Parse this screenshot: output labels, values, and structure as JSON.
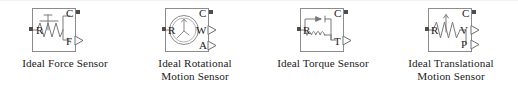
{
  "page": {
    "background_color": "#ffffff",
    "block_line_color": "#8c8c8c",
    "symbol_color": "#7a7a7a",
    "port_color": "#4d4d4d",
    "text_color": "#1b1b1b"
  },
  "blocks": [
    {
      "id": "ideal-force-sensor",
      "caption_line1": "Ideal Force Sensor",
      "caption_line2": "",
      "symbol": "spring-plunger",
      "ports": [
        {
          "name": "R",
          "label": "R",
          "kind": "conserving",
          "side": "left"
        },
        {
          "name": "C",
          "label": "C",
          "kind": "conserving",
          "side": "right-top"
        },
        {
          "name": "F",
          "label": "F",
          "kind": "signal",
          "side": "right-bottom"
        }
      ]
    },
    {
      "id": "ideal-rotational-motion-sensor",
      "caption_line1": "Ideal Rotational",
      "caption_line2": "Motion Sensor",
      "symbol": "gauge-dial",
      "ports": [
        {
          "name": "R",
          "label": "R",
          "kind": "conserving",
          "side": "left"
        },
        {
          "name": "C",
          "label": "C",
          "kind": "conserving",
          "side": "right-top"
        },
        {
          "name": "W",
          "label": "W",
          "kind": "signal",
          "side": "right-mid"
        },
        {
          "name": "A",
          "label": "A",
          "kind": "signal",
          "side": "right-bottom"
        }
      ]
    },
    {
      "id": "ideal-torque-sensor",
      "caption_line1": "Ideal Torque Sensor",
      "caption_line2": "",
      "symbol": "arrow-coil",
      "ports": [
        {
          "name": "R",
          "label": "R",
          "kind": "conserving",
          "side": "left"
        },
        {
          "name": "C",
          "label": "C",
          "kind": "conserving",
          "side": "right-top"
        },
        {
          "name": "T",
          "label": "T",
          "kind": "signal",
          "side": "right-bottom"
        }
      ]
    },
    {
      "id": "ideal-translational-motion-sensor",
      "caption_line1": "Ideal Translational",
      "caption_line2": "Motion Sensor",
      "symbol": "spring-arrow",
      "ports": [
        {
          "name": "R",
          "label": "R",
          "kind": "conserving",
          "side": "left"
        },
        {
          "name": "C",
          "label": "C",
          "kind": "conserving",
          "side": "right-top"
        },
        {
          "name": "V",
          "label": "V",
          "kind": "signal",
          "side": "right-mid"
        },
        {
          "name": "P",
          "label": "P",
          "kind": "signal",
          "side": "right-bottom"
        }
      ]
    }
  ]
}
